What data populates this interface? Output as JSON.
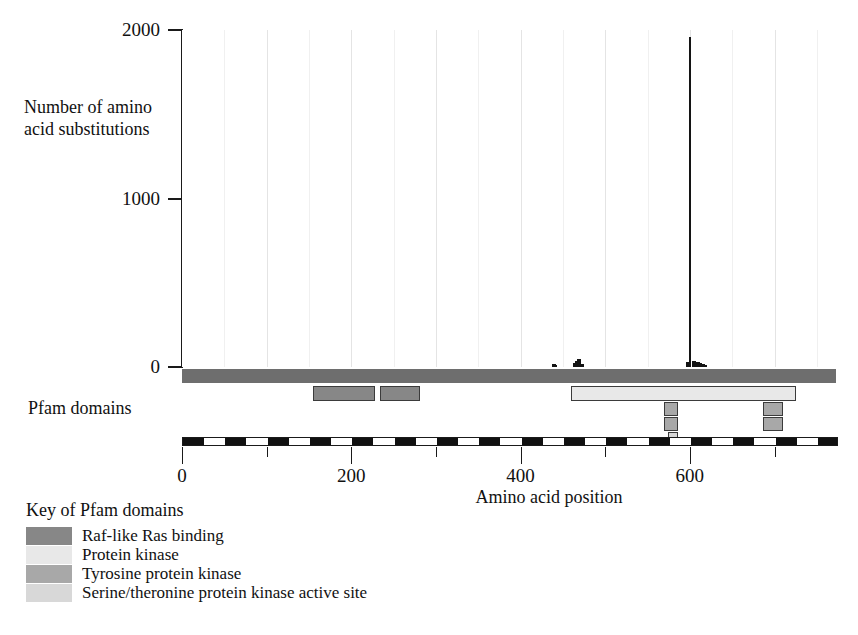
{
  "figure": {
    "pfam_track_label": "Pfam domains",
    "legend_title": "Key of Pfam domains"
  },
  "chart_data": {
    "type": "bar",
    "title": "",
    "xlabel": "Amino acid position",
    "ylabel": "Number of amino acid substitutions",
    "xlim": [
      0,
      775
    ],
    "ylim": [
      0,
      2000
    ],
    "xticks": [
      0,
      200,
      400,
      600
    ],
    "xtick_labels": [
      "0",
      "200",
      "400",
      "600"
    ],
    "xticks_minor": [
      100,
      300,
      500,
      700
    ],
    "yticks": [
      0,
      1000,
      2000
    ],
    "ytick_labels": [
      "0",
      "1000",
      "2000"
    ],
    "grid": "vertical-faint-every-50",
    "legend_position": "below-left",
    "series": [
      {
        "name": "Amino acid substitutions",
        "color": "#141414",
        "x": [
          438,
          440,
          463,
          466,
          468,
          471,
          597,
          600,
          604,
          608,
          611,
          614,
          617
        ],
        "values": [
          18,
          14,
          22,
          34,
          46,
          20,
          30,
          1960,
          36,
          30,
          22,
          16,
          14
        ]
      }
    ],
    "annotations": [
      {
        "text": "dominant substitution peak",
        "x": 600,
        "y": 1960
      }
    ]
  },
  "pfam_domains": {
    "backbone": {
      "start": 0,
      "end": 775,
      "color": "#6e6e6e"
    },
    "boxes": [
      {
        "name": "Raf-like Ras binding",
        "start": 155,
        "end": 228,
        "row": 0,
        "color": "#878787"
      },
      {
        "name": "Raf-like Ras binding",
        "start": 234,
        "end": 281,
        "row": 0,
        "color": "#878787"
      },
      {
        "name": "Protein kinase",
        "start": 459,
        "end": 725,
        "row": 0,
        "color": "#e8e8e8"
      },
      {
        "name": "Tyrosine protein kinase",
        "start": 569,
        "end": 586,
        "row": 1,
        "color": "#a8a8a8"
      },
      {
        "name": "Tyrosine protein kinase",
        "start": 686,
        "end": 710,
        "row": 1,
        "color": "#a8a8a8"
      },
      {
        "name": "Tyrosine protein kinase",
        "start": 569,
        "end": 586,
        "row": 2,
        "color": "#a8a8a8"
      },
      {
        "name": "Tyrosine protein kinase",
        "start": 686,
        "end": 710,
        "row": 2,
        "color": "#a8a8a8"
      },
      {
        "name": "Serine/theronine protein kinase active site",
        "start": 574,
        "end": 586,
        "row": 3,
        "color": "#d8d8d8"
      }
    ]
  },
  "legend": {
    "items": [
      {
        "label": "Raf-like Ras binding",
        "color": "#878787"
      },
      {
        "label": "Protein kinase",
        "color": "#e8e8e8"
      },
      {
        "label": "Tyrosine protein kinase",
        "color": "#a8a8a8"
      },
      {
        "label": "Serine/theronine protein kinase active site",
        "color": "#d8d8d8"
      }
    ]
  }
}
